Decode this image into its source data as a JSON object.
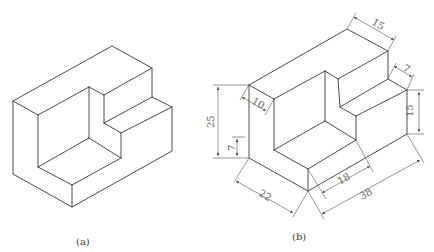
{
  "figures": [
    {
      "id": "a",
      "caption": "(a)",
      "description": "Isometric view of L-shaped stepped block"
    },
    {
      "id": "b",
      "caption": "(b)",
      "description": "Isometric view of stepped block with dimensions",
      "dimensions": {
        "top_depth": "15",
        "step_depth": "7",
        "right_height": "15",
        "total_height": "25",
        "wall_thickness": "10",
        "base_height": "7",
        "front_width": "22",
        "inner_length": "18",
        "total_length": "38"
      }
    }
  ],
  "colors": {
    "line": "#3a3a3a",
    "dimension": "#555555",
    "background": "#ffffff"
  }
}
